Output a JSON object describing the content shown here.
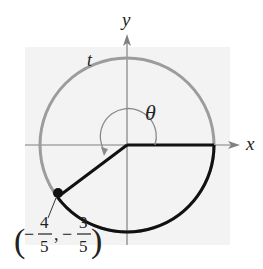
{
  "figure": {
    "type": "unit-circle-angle",
    "axes": {
      "x_label": "x",
      "y_label": "y"
    },
    "labels": {
      "arc_label": "t",
      "angle_label": "θ"
    },
    "point": {
      "x_num": "4",
      "x_den": "5",
      "y_num": "3",
      "y_den": "5",
      "x_sign": "−",
      "y_sign": "−",
      "open_paren": "(",
      "close_paren": ")",
      "comma": ","
    },
    "colors": {
      "background_shade": "#f2f2f2",
      "axis": "#7a7a7a",
      "circle_gray": "#9a9a9a",
      "arc_black": "#111111",
      "text": "#222222"
    }
  }
}
